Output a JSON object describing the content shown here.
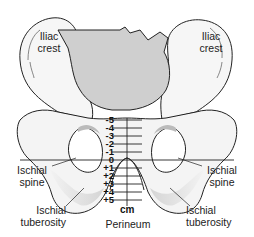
{
  "diagram": {
    "labels": {
      "iliac_crest_left": [
        "Iliac",
        "crest"
      ],
      "iliac_crest_right": [
        "Iliac",
        "crest"
      ],
      "ischial_spine_left": [
        "Ischial",
        "spine"
      ],
      "ischial_spine_right": [
        "Ischial",
        "spine"
      ],
      "ischial_tuberosity_left": [
        "Ischial",
        "tuberosity"
      ],
      "ischial_tuberosity_right": [
        "Ischial",
        "tuberosity"
      ],
      "perineum": "Perineum",
      "unit": "cm"
    },
    "scale": {
      "stations": [
        "-5",
        "-4",
        "-3",
        "-2",
        "-1",
        "0",
        "+1",
        "+2",
        "+3",
        "+4",
        "+5"
      ]
    },
    "colors": {
      "bone_fill": "#f4f4f4",
      "sacrum_fill": "#cfcfcf",
      "shade_fill": "#d6d6d6",
      "outline": "#222222",
      "background": "#ffffff"
    }
  }
}
